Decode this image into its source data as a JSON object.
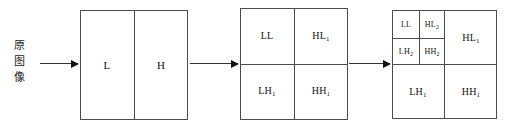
{
  "diagram": {
    "source": {
      "label": "原图像",
      "chars": [
        "原",
        "图",
        "像"
      ]
    },
    "arrows": [
      {
        "name": "arrow-source-to-stage1"
      },
      {
        "name": "arrow-stage1-to-stage2"
      },
      {
        "name": "arrow-stage2-to-stage3"
      }
    ],
    "stage1": {
      "name": "L/H split",
      "cells": [
        {
          "label": "L",
          "sub": ""
        },
        {
          "label": "H",
          "sub": ""
        }
      ]
    },
    "stage2": {
      "name": "first level decomposition",
      "cells": [
        {
          "label": "LL",
          "sub": ""
        },
        {
          "label": "HL",
          "sub": "1"
        },
        {
          "label": "LH",
          "sub": "1"
        },
        {
          "label": "HH",
          "sub": "1"
        }
      ]
    },
    "stage3": {
      "name": "second level decomposition",
      "cells": [
        {
          "label": "LL",
          "sub": ""
        },
        {
          "label": "HL",
          "sub": "2"
        },
        {
          "label": "LH",
          "sub": "2"
        },
        {
          "label": "HH",
          "sub": "2"
        },
        {
          "label": "HL",
          "sub": "1"
        },
        {
          "label": "LH",
          "sub": "1"
        },
        {
          "label": "HH",
          "sub": "1"
        }
      ]
    },
    "colors": {
      "stroke": "#4d4d4d",
      "arrow": "#333333",
      "text": "#111111",
      "background": "#ffffff"
    }
  }
}
